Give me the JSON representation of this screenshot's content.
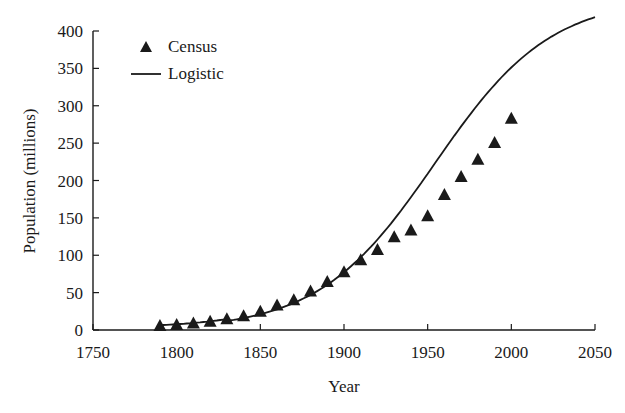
{
  "chart_data": {
    "type": "line",
    "title": "",
    "xlabel": "Year",
    "ylabel": "Population (millions)",
    "xlim": [
      1750,
      2050
    ],
    "ylim": [
      0,
      400
    ],
    "x_ticks": [
      1750,
      1800,
      1850,
      1900,
      1950,
      2000,
      2050
    ],
    "y_ticks": [
      0,
      50,
      100,
      150,
      200,
      250,
      300,
      350,
      400
    ],
    "grid": false,
    "legend": {
      "position": "upper-left",
      "entries": [
        {
          "label": "Census",
          "marker": "filled-triangle"
        },
        {
          "label": "Logistic",
          "marker": "solid-line"
        }
      ]
    },
    "series": [
      {
        "name": "Census",
        "kind": "scatter",
        "marker": "triangle",
        "x": [
          1790,
          1800,
          1810,
          1820,
          1830,
          1840,
          1850,
          1860,
          1870,
          1880,
          1890,
          1900,
          1910,
          1920,
          1930,
          1940,
          1950,
          1960,
          1970,
          1980,
          1990,
          2000
        ],
        "values": [
          3.9,
          5.3,
          7.2,
          9.6,
          12.9,
          17.1,
          23.2,
          31.4,
          38.6,
          50.2,
          62.9,
          76.0,
          92.0,
          105.7,
          122.8,
          131.7,
          150.7,
          179.3,
          203.2,
          226.5,
          248.7,
          281.4
        ]
      },
      {
        "name": "Logistic",
        "kind": "line",
        "x": [
          1790,
          1800,
          1810,
          1820,
          1830,
          1840,
          1850,
          1860,
          1870,
          1880,
          1890,
          1900,
          1910,
          1920,
          1930,
          1940,
          1950,
          1960,
          1970,
          1980,
          1990,
          2000,
          2010,
          2020,
          2030,
          2040,
          2050
        ],
        "values": [
          7.0,
          8.7,
          10.8,
          13.4,
          16.6,
          20.5,
          25.2,
          30.9,
          37.8,
          46.0,
          55.6,
          66.7,
          79.4,
          93.6,
          109.2,
          126.0,
          143.7,
          162.0,
          180.4,
          198.6,
          248.0,
          281.0,
          305.0,
          325.0,
          342.0,
          356.0,
          368.0
        ]
      }
    ]
  },
  "legend": {
    "census_label": "Census",
    "logistic_label": "Logistic"
  },
  "axes": {
    "xlabel": "Year",
    "ylabel": "Population (millions)",
    "x_tick_labels": [
      "1750",
      "1800",
      "1850",
      "1900",
      "1950",
      "2000",
      "2050"
    ],
    "y_tick_labels": [
      "0",
      "50",
      "100",
      "150",
      "200",
      "250",
      "300",
      "350",
      "400"
    ]
  },
  "colors": {
    "ink": "#1a1a1a",
    "background": "#ffffff"
  }
}
